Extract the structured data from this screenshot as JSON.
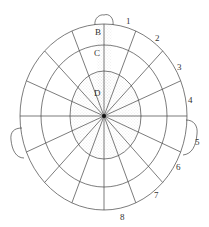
{
  "diagram": {
    "type": "polar-grid-head-map",
    "rings": [
      {
        "label": "D",
        "stippled": true
      },
      {
        "label": "C",
        "stippled": "partial"
      },
      {
        "label": "B",
        "stippled": "partial"
      },
      {
        "label": "",
        "stippled": false
      }
    ],
    "spoke_count": 16,
    "sector_labels": [
      "1",
      "2",
      "3",
      "4",
      "5",
      "6",
      "7",
      "8"
    ],
    "ring_labels": [
      "B",
      "C",
      "D"
    ],
    "features": [
      "nose-at-top",
      "left-ear",
      "right-ear",
      "center-point"
    ],
    "colors": {
      "line": "#444444",
      "stipple": "#bbbbbb",
      "background": "#ffffff"
    }
  }
}
